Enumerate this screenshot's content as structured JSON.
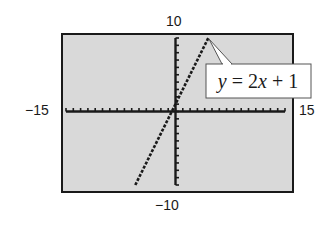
{
  "chart_data": {
    "type": "line",
    "title": "",
    "xlabel": "",
    "ylabel": "",
    "xlim": [
      -15,
      15
    ],
    "ylim": [
      -10,
      10
    ],
    "x_scale": 1,
    "y_scale": 1,
    "grid": false,
    "tick_labels": {
      "xmin": "−15",
      "xmax": "15",
      "ymin": "−10",
      "ymax": "10"
    },
    "series": [
      {
        "name": "y = 2x + 1",
        "equation": "y = 2x + 1",
        "style": "dotted",
        "x": [
          -5.5,
          4.5
        ],
        "y": [
          -10,
          10
        ]
      }
    ],
    "annotations": [
      {
        "text": "y = 2x + 1",
        "points_to": [
          4.5,
          10
        ]
      }
    ],
    "colors": {
      "screen_background": "#d9d9d9",
      "frame": "#1a1a1a",
      "plot": "#1a1a1a",
      "callout_background": "#ffffff"
    }
  },
  "labels": {
    "ymax": "10",
    "ymin": "−10",
    "xmin": "−15",
    "xmax": "15",
    "callout": "y = 2x + 1"
  }
}
